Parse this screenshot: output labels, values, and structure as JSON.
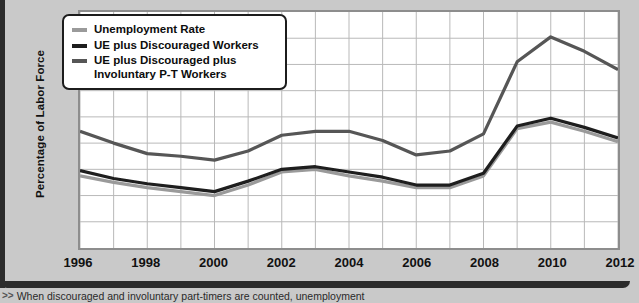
{
  "chart_data": {
    "type": "line",
    "title": "",
    "xlabel": "",
    "ylabel": "Percentage of Labor Force",
    "x": [
      1996,
      1997,
      1998,
      1999,
      2000,
      2001,
      2002,
      2003,
      2004,
      2005,
      2006,
      2007,
      2008,
      2009,
      2010,
      2011,
      2012
    ],
    "xlim": [
      1996,
      2012
    ],
    "ylim": [
      0,
      18
    ],
    "xticks": [
      1996,
      1998,
      2000,
      2002,
      2004,
      2006,
      2008,
      2010,
      2012
    ],
    "xtick_labels": [
      "1996",
      "1998",
      "2000",
      "2002",
      "2004",
      "2006",
      "2008",
      "2010",
      "2012"
    ],
    "yticks": [
      0,
      2,
      4,
      6,
      8,
      10,
      12,
      14,
      16,
      18
    ],
    "ytick_labels": [
      "0",
      "2",
      "4",
      "6",
      "8",
      "10",
      "12",
      "14",
      "16",
      "18"
    ],
    "grid": true,
    "legend_position": "upper-left",
    "series": [
      {
        "name": "Unemployment Rate",
        "color": "#9a9a9a",
        "values": [
          5.5,
          5.0,
          4.6,
          4.3,
          4.0,
          4.8,
          5.8,
          6.0,
          5.5,
          5.1,
          4.6,
          4.6,
          5.5,
          9.1,
          9.6,
          8.9,
          8.1
        ]
      },
      {
        "name": "UE plus Discouraged Workers",
        "color": "#1e1e1e",
        "values": [
          5.9,
          5.3,
          4.9,
          4.6,
          4.3,
          5.1,
          6.0,
          6.2,
          5.8,
          5.4,
          4.8,
          4.8,
          5.7,
          9.3,
          9.9,
          9.2,
          8.4
        ]
      },
      {
        "name": "UE plus Discouraged plus\nInvoluntary P-T Workers",
        "color": "#565656",
        "values": [
          8.9,
          8.0,
          7.2,
          7.0,
          6.7,
          7.4,
          8.6,
          8.9,
          8.9,
          8.2,
          7.1,
          7.4,
          8.7,
          14.2,
          16.1,
          15.0,
          13.6
        ]
      }
    ]
  },
  "axes": {
    "y_title": "Percentage of Labor Force"
  },
  "legend": {
    "items": [
      {
        "label": "Unemployment Rate",
        "color": "#9a9a9a"
      },
      {
        "label": "UE plus Discouraged Workers",
        "color": "#1e1e1e"
      },
      {
        "label": "UE plus Discouraged plus\nInvoluntary P-T Workers",
        "color": "#565656"
      }
    ]
  },
  "caption": {
    "marker": ">>",
    "text": "When discouraged and involuntary part-timers are counted, unemployment"
  },
  "colors": {
    "page_background": "#c9c9c9",
    "plot_background": "#ffffff",
    "grid": "#b9b9b9",
    "frame": "#8d8d8d",
    "outer_frame": "#2b2b2b"
  }
}
